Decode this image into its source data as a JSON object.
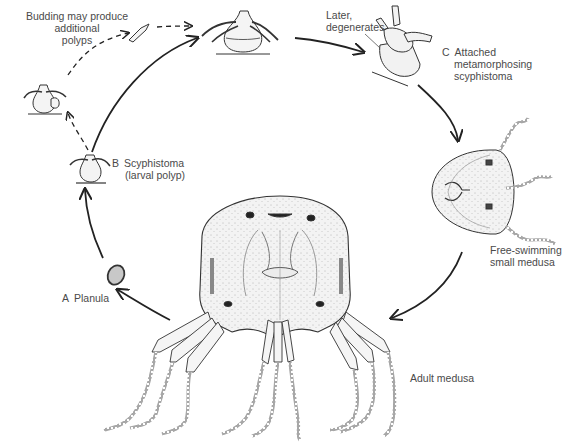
{
  "figure": {
    "colors": {
      "ink": "#222222",
      "text": "#4a4a4a",
      "stipple_fill": "#efefef",
      "planula_fill": "#c8c8c8",
      "background": "#ffffff"
    }
  },
  "labels": {
    "budding": {
      "lines": [
        "Budding may produce",
        "additional",
        "polyps"
      ]
    },
    "later": {
      "lines": [
        "Later,",
        "degenerates"
      ]
    },
    "stage_c": {
      "letter": "C",
      "lines": [
        "Attached",
        "metamorphosing",
        "scyphistoma"
      ]
    },
    "stage_b": {
      "letter": "B",
      "lines": [
        "Scyphistoma",
        "(larval polyp)"
      ]
    },
    "free_swimming": {
      "lines": [
        "Free-swimming",
        "small medusa"
      ]
    },
    "stage_a": {
      "letter": "A",
      "text": "Planula"
    },
    "adult": {
      "text": "Adult medusa"
    }
  },
  "stages": [
    {
      "id": "planula",
      "letter": "A",
      "name": "Planula"
    },
    {
      "id": "scyphistoma",
      "letter": "B",
      "name": "Scyphistoma (larval polyp)"
    },
    {
      "id": "polyp-top",
      "name": "Polyp"
    },
    {
      "id": "metamorphosing",
      "letter": "C",
      "name": "Attached metamorphosing scyphistoma"
    },
    {
      "id": "small-medusa",
      "name": "Free-swimming small medusa"
    },
    {
      "id": "adult-medusa",
      "name": "Adult medusa"
    }
  ],
  "arrows": [
    {
      "from": "adult-medusa",
      "to": "planula",
      "style": "solid"
    },
    {
      "from": "planula",
      "to": "scyphistoma",
      "style": "solid"
    },
    {
      "from": "scyphistoma",
      "to": "polyp-top",
      "style": "solid"
    },
    {
      "from": "polyp-top",
      "to": "metamorphosing",
      "style": "solid"
    },
    {
      "from": "metamorphosing",
      "to": "small-medusa",
      "style": "solid"
    },
    {
      "from": "small-medusa",
      "to": "adult-medusa",
      "style": "solid"
    },
    {
      "from": "scyphistoma",
      "to": "budding-polyp",
      "style": "dashed"
    },
    {
      "from": "budding-polyp",
      "to": "bud",
      "style": "dashed"
    },
    {
      "from": "bud",
      "to": "polyp-top",
      "style": "dashed"
    }
  ]
}
